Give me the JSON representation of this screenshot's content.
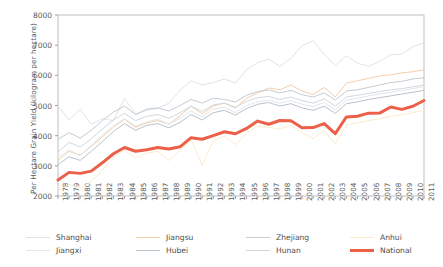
{
  "chart_data": {
    "type": "line",
    "title": "",
    "xlabel": "",
    "ylabel": "Per Hectare Grain Yield (kilogram per hectare)",
    "xlim": [
      1978,
      2011
    ],
    "ylim": [
      2000,
      8000
    ],
    "yticks": [
      2000,
      3000,
      4000,
      5000,
      6000,
      7000,
      8000
    ],
    "grid": false,
    "legend_position": "bottom",
    "x": [
      1978,
      1979,
      1980,
      1981,
      1982,
      1983,
      1984,
      1985,
      1986,
      1987,
      1988,
      1989,
      1990,
      1991,
      1992,
      1993,
      1994,
      1995,
      1996,
      1997,
      1998,
      1999,
      2000,
      2001,
      2002,
      2003,
      2004,
      2005,
      2006,
      2007,
      2008,
      2009,
      2010,
      2011
    ],
    "xticklabels": [
      "1978",
      "1979",
      "1980",
      "1981",
      "1982",
      "1983",
      "1984",
      "1985",
      "1986",
      "1987",
      "1988",
      "1989",
      "1990",
      "1991",
      "1992",
      "1993",
      "1994",
      "1995",
      "1996",
      "1997",
      "1998",
      "1999",
      "2000",
      "2001",
      "2002",
      "2003",
      "2004",
      "2005",
      "2006",
      "2007",
      "2008",
      "2009",
      "2010",
      "2011"
    ],
    "series": [
      {
        "name": "Shanghai",
        "color": "#dfe4e8",
        "width": 1.0,
        "values": [
          4980,
          4520,
          4880,
          4380,
          4560,
          4500,
          5230,
          4720,
          4840,
          4900,
          5080,
          5500,
          5820,
          5680,
          5760,
          5880,
          5740,
          6180,
          6420,
          6540,
          6300,
          6560,
          6980,
          7150,
          6700,
          6330,
          6650,
          6400,
          6300,
          6460,
          6680,
          6700,
          6950,
          7080
        ]
      },
      {
        "name": "Jiangsu",
        "color": "#f3cfae",
        "width": 1.0,
        "values": [
          3180,
          3480,
          3360,
          3640,
          3960,
          4280,
          4540,
          4280,
          4420,
          4500,
          4380,
          4660,
          4980,
          4720,
          4980,
          5080,
          4920,
          5240,
          5420,
          5580,
          5520,
          5680,
          5480,
          5360,
          5600,
          5280,
          5740,
          5820,
          5900,
          5980,
          6020,
          6080,
          6120,
          6180
        ]
      },
      {
        "name": "Zhejiang",
        "color": "#c4ccd4",
        "width": 1.0,
        "values": [
          3880,
          4100,
          3920,
          4180,
          4500,
          4780,
          4980,
          4700,
          4880,
          4920,
          4820,
          5000,
          5200,
          5080,
          5240,
          5200,
          5120,
          5340,
          5460,
          5520,
          5420,
          5500,
          5360,
          5280,
          5420,
          5180,
          5480,
          5520,
          5600,
          5680,
          5760,
          5800,
          5880,
          5920
        ]
      },
      {
        "name": "Anhui",
        "color": "#fbeccd",
        "width": 1.0,
        "values": [
          2180,
          2380,
          2260,
          2480,
          2860,
          3280,
          3520,
          3260,
          3420,
          3480,
          3180,
          3500,
          3860,
          3020,
          3840,
          3980,
          3700,
          4080,
          4320,
          4280,
          4220,
          4340,
          4100,
          3900,
          4180,
          3720,
          4360,
          4420,
          4500,
          4560,
          4640,
          4700,
          4760,
          4840
        ]
      },
      {
        "name": "Jiangxi",
        "color": "#e2e7ea",
        "width": 1.0,
        "values": [
          3280,
          3520,
          3340,
          3680,
          4020,
          4320,
          4560,
          4320,
          4460,
          4540,
          4380,
          4580,
          4820,
          4620,
          4880,
          4940,
          4760,
          5000,
          5120,
          5180,
          5080,
          5160,
          5040,
          4960,
          5100,
          4860,
          5180,
          5240,
          5320,
          5380,
          5440,
          5500,
          5560,
          5620
        ]
      },
      {
        "name": "Hubei",
        "color": "#b8c2cc",
        "width": 1.0,
        "values": [
          3040,
          3300,
          3180,
          3480,
          3800,
          4140,
          4400,
          4180,
          4340,
          4400,
          4260,
          4440,
          4700,
          4520,
          4760,
          4840,
          4680,
          4900,
          5040,
          5100,
          4980,
          5060,
          4920,
          4840,
          4980,
          4740,
          5060,
          5120,
          5200,
          5260,
          5320,
          5380,
          5440,
          5500
        ]
      },
      {
        "name": "Hunan",
        "color": "#cfd8e0",
        "width": 1.0,
        "values": [
          3460,
          3780,
          3620,
          3900,
          4220,
          4520,
          4740,
          4500,
          4640,
          4700,
          4580,
          4760,
          4980,
          4800,
          5020,
          5080,
          4940,
          5140,
          5260,
          5300,
          5200,
          5280,
          5160,
          5080,
          5220,
          4980,
          5280,
          5340,
          5400,
          5460,
          5520,
          5560,
          5620,
          5680
        ]
      },
      {
        "name": "National",
        "color": "#ec5f49",
        "width": 3.0,
        "values": [
          2528,
          2783,
          2750,
          2825,
          3100,
          3400,
          3608,
          3483,
          3530,
          3610,
          3560,
          3630,
          3933,
          3880,
          4004,
          4131,
          4063,
          4240,
          4483,
          4377,
          4502,
          4493,
          4261,
          4267,
          4399,
          4067,
          4620,
          4642,
          4746,
          4748,
          4951,
          4871,
          4974,
          5166
        ]
      }
    ],
    "legend_entries": [
      {
        "label": "Shanghai",
        "color": "#dfe4e8",
        "width": 1.0
      },
      {
        "label": "Jiangsu",
        "color": "#f3cfae",
        "width": 1.0
      },
      {
        "label": "Zhejiang",
        "color": "#c4ccd4",
        "width": 1.0
      },
      {
        "label": "Anhui",
        "color": "#fbeccd",
        "width": 1.0
      },
      {
        "label": "Jiangxi",
        "color": "#e2e7ea",
        "width": 1.0
      },
      {
        "label": "Hubei",
        "color": "#b8c2cc",
        "width": 1.0
      },
      {
        "label": "Hunan",
        "color": "#cfd8e0",
        "width": 1.0
      },
      {
        "label": "National",
        "color": "#ec5f49",
        "width": 3.0
      }
    ]
  },
  "axes": {
    "spine_color": "#b0b0b0",
    "tick_color": "#8c8c8c",
    "text_color": "#5a5a5a"
  }
}
